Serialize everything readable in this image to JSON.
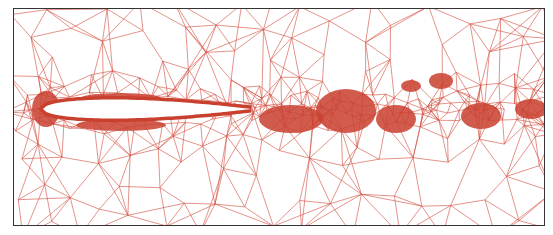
{
  "figure": {
    "kind": "unstructured triangular mesh around airfoil with wake refinement",
    "mesh_color": "#d2493a",
    "dense_color": "#c9402f",
    "frame_color": "#333333",
    "background": "#ffffff",
    "airfoil": {
      "leading_edge_x": 42,
      "trailing_edge_x": 250,
      "center_y": 108,
      "thickness": 22
    },
    "dense_blobs": [
      {
        "x": 45,
        "y": 108,
        "rx": 14,
        "ry": 18
      },
      {
        "x": 120,
        "y": 97,
        "rx": 40,
        "ry": 5
      },
      {
        "x": 120,
        "y": 124,
        "rx": 45,
        "ry": 6
      },
      {
        "x": 290,
        "y": 118,
        "rx": 32,
        "ry": 14
      },
      {
        "x": 345,
        "y": 110,
        "rx": 30,
        "ry": 22
      },
      {
        "x": 395,
        "y": 118,
        "rx": 20,
        "ry": 14
      },
      {
        "x": 410,
        "y": 85,
        "rx": 10,
        "ry": 6
      },
      {
        "x": 440,
        "y": 80,
        "rx": 12,
        "ry": 8
      },
      {
        "x": 480,
        "y": 115,
        "rx": 20,
        "ry": 13
      },
      {
        "x": 530,
        "y": 108,
        "rx": 16,
        "ry": 10
      }
    ]
  }
}
